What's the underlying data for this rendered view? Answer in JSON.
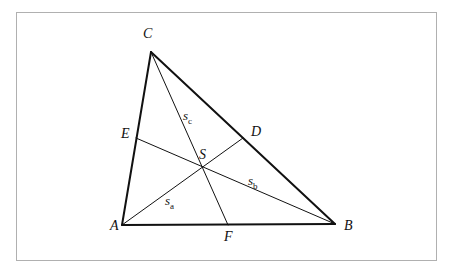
{
  "figure": {
    "kind": "geometry-diagram",
    "canvas": {
      "width": 454,
      "height": 273
    },
    "background_color": "#ffffff",
    "frame": {
      "x": 16,
      "y": 12,
      "width": 420,
      "height": 248,
      "stroke_color": "#b0b0b0",
      "stroke_width": 1
    },
    "styles": {
      "side_stroke_color": "#111111",
      "side_stroke_width": 2,
      "median_stroke_color": "#111111",
      "median_stroke_width": 1,
      "label_color": "#111111"
    },
    "points": {
      "A": {
        "name": "A",
        "x": 122,
        "y": 225,
        "label_x": 110,
        "label_y": 230,
        "role": "vertex"
      },
      "B": {
        "name": "B",
        "x": 335,
        "y": 224,
        "label_x": 344,
        "label_y": 230,
        "role": "vertex"
      },
      "C": {
        "name": "C",
        "x": 151,
        "y": 52,
        "label_x": 143,
        "label_y": 38,
        "role": "vertex"
      },
      "D": {
        "name": "D",
        "x": 243,
        "y": 138,
        "label_x": 251,
        "label_y": 136,
        "role": "midpoint-of-CB"
      },
      "E": {
        "name": "E",
        "x": 136,
        "y": 138,
        "label_x": 121,
        "label_y": 138,
        "role": "midpoint-of-AC"
      },
      "F": {
        "name": "F",
        "x": 228,
        "y": 225,
        "label_x": 224,
        "label_y": 241,
        "role": "midpoint-of-AB"
      },
      "S": {
        "name": "S",
        "x": 203,
        "y": 166,
        "label_x": 199,
        "label_y": 159,
        "role": "centroid"
      }
    },
    "sides": [
      {
        "name": "side-AB",
        "from": "A",
        "to": "B"
      },
      {
        "name": "side-BC",
        "from": "B",
        "to": "C"
      },
      {
        "name": "side-CA",
        "from": "C",
        "to": "A"
      }
    ],
    "medians": [
      {
        "name": "median-AD",
        "from": "A",
        "to": "D",
        "label_base": "s",
        "label_sub": "a",
        "label_x": 165,
        "label_y": 205
      },
      {
        "name": "median-BE",
        "from": "B",
        "to": "E",
        "label_base": "s",
        "label_sub": "b",
        "label_x": 248,
        "label_y": 185
      },
      {
        "name": "median-CF",
        "from": "C",
        "to": "F",
        "label_base": "s",
        "label_sub": "c",
        "label_x": 183,
        "label_y": 120
      }
    ]
  }
}
